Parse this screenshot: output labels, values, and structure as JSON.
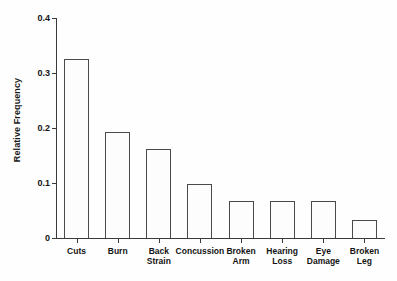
{
  "chart_data": {
    "type": "bar",
    "title": "",
    "xlabel": "",
    "ylabel": "Relative Frequency",
    "categories": [
      "Cuts",
      "Burn",
      "Back\nStrain",
      "Concussion",
      "Broken\nArm",
      "Hearing\nLoss",
      "Eye\nDamage",
      "Broken\nLeg"
    ],
    "values": [
      0.325,
      0.193,
      0.161,
      0.098,
      0.068,
      0.068,
      0.068,
      0.033
    ],
    "ylim": [
      0,
      0.4
    ],
    "yticks": [
      0,
      0.1,
      0.2,
      0.3,
      0.4
    ],
    "ytick_labels": [
      "0",
      "0.1",
      "0.2",
      "0.3",
      "0.4"
    ],
    "grid": false,
    "legend": false,
    "bar_fill_color": "#fdfdfd",
    "bar_edge_color": "#4a4a4a",
    "axis_color": "#3a3a3a",
    "background_color": "#fefefe"
  }
}
